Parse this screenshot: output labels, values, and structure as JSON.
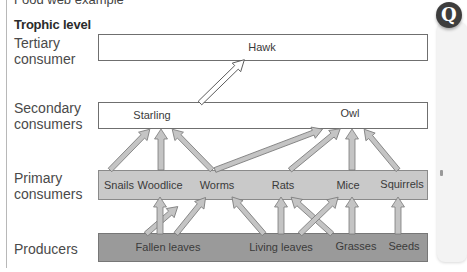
{
  "heading_cut": "Food web example",
  "heading": "Trophic level",
  "levels": [
    {
      "label_line1": "Tertiary",
      "label_line2": "consumer"
    },
    {
      "label_line1": "Secondary",
      "label_line2": "consumers"
    },
    {
      "label_line1": "Primary",
      "label_line2": "consumers"
    },
    {
      "label_line1": "Producers",
      "label_line2": ""
    }
  ],
  "tertiary": [
    "Hawk"
  ],
  "secondary": [
    "Starling",
    "Owl"
  ],
  "primary": [
    "Snails",
    "Woodlice",
    "Worms",
    "Rats",
    "Mice",
    "Squirrels"
  ],
  "producers": [
    "Fallen leaves",
    "Living leaves",
    "Grasses",
    "Seeds"
  ],
  "badge": "Q",
  "colors": {
    "white_box": "#ffffff",
    "primary_box": "#c9c9c9",
    "producer_box": "#9a9a9a",
    "arrow_fill": "#c4c4c4",
    "arrow_stroke": "#7a7a7a"
  },
  "links": [
    {
      "from": "Fallen leaves",
      "to": "Snails"
    },
    {
      "from": "Fallen leaves",
      "to": "Woodlice"
    },
    {
      "from": "Fallen leaves",
      "to": "Worms"
    },
    {
      "from": "Living leaves",
      "to": "Worms"
    },
    {
      "from": "Living leaves",
      "to": "Rats"
    },
    {
      "from": "Living leaves",
      "to": "Mice"
    },
    {
      "from": "Grasses",
      "to": "Rats"
    },
    {
      "from": "Grasses",
      "to": "Mice"
    },
    {
      "from": "Seeds",
      "to": "Squirrels"
    },
    {
      "from": "Snails",
      "to": "Starling"
    },
    {
      "from": "Woodlice",
      "to": "Starling"
    },
    {
      "from": "Worms",
      "to": "Starling"
    },
    {
      "from": "Worms",
      "to": "Owl"
    },
    {
      "from": "Rats",
      "to": "Owl"
    },
    {
      "from": "Mice",
      "to": "Owl"
    },
    {
      "from": "Squirrels",
      "to": "Owl"
    },
    {
      "from": "Starling",
      "to": "Hawk"
    }
  ]
}
